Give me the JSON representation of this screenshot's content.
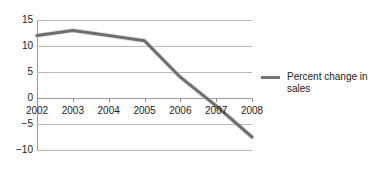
{
  "chart_data": {
    "type": "line",
    "title": "",
    "xlabel": "",
    "ylabel": "",
    "categories": [
      "2002",
      "2003",
      "2004",
      "2005",
      "2006",
      "2007",
      "2008"
    ],
    "series": [
      {
        "name": "Percent change in sales",
        "values": [
          12,
          13,
          12,
          11,
          4,
          -1.5,
          -7.5
        ]
      }
    ],
    "ylim": [
      -10,
      15
    ],
    "ytick_labels": [
      "15",
      "10",
      "5",
      "0",
      "−5",
      "−10"
    ],
    "ytick_values": [
      15,
      10,
      5,
      0,
      -5,
      -10
    ],
    "grid": true,
    "legend_position": "right",
    "line_color": "#6e6e6e",
    "grid_color": "#b9b9b9",
    "axis_color": "#9a9a9a",
    "text_color": "#1a1a1a"
  },
  "legend": {
    "entries": [
      {
        "label": "Percent change in sales",
        "color": "#777777"
      }
    ]
  }
}
